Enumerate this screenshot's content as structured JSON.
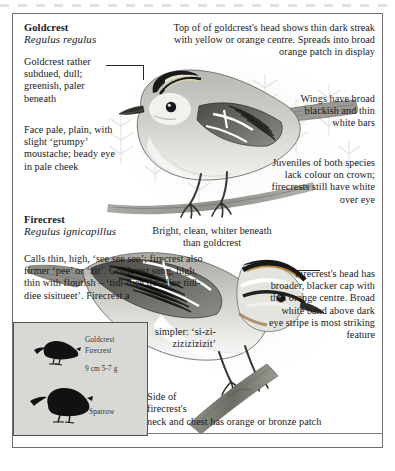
{
  "plate": {
    "goldcrest": {
      "common_name": "Goldcrest",
      "latin_name": "Regulus regulus",
      "caption_plumage": "Goldcrest rather subdued, dull; greenish, paler beneath",
      "caption_face": "Face pale, plain, with slight ‘grumpy’ moustache; beady eye in pale cheek",
      "caption_crown": "Top of of goldcrest's head shows thin dark streak with yellow or orange centre. Spreads into broad orange patch in display",
      "caption_wings": "Wings have broad blackish and thin white bars"
    },
    "firecrest": {
      "common_name": "Firecrest",
      "latin_name": "Regulus ignicapillus",
      "caption_calls": "Calls thin, high, ‘see see see’; firecrest also firmer ‘pee’ or ‘zit’. Goldcrest song, high, thin with flourish – ‘tidl-diee tidl-diee tidl-diee sisitueet’. Firecrest a",
      "caption_calls_cont": "simpler: ‘si-zi-zizizizizit’",
      "caption_underparts": "Bright, clean, whiter beneath than goldcrest",
      "caption_head": "Firecrest's head has broader, blacker cap with thin orange centre. Broad white band above dark eye stripe is most striking feature",
      "caption_neck": "Side of firecrest's",
      "caption_neck_cont": "neck and chest has orange or bronze patch"
    },
    "shared": {
      "caption_juveniles": "Juveniles of both species lack colour on crown; firecrests still have white over eye"
    },
    "size_box": {
      "label_goldcrest": "Goldcrest",
      "label_firecrest": "Firecrest",
      "measurements": "9 cm  5-7 g",
      "label_sparrow": "Sparrow"
    }
  }
}
